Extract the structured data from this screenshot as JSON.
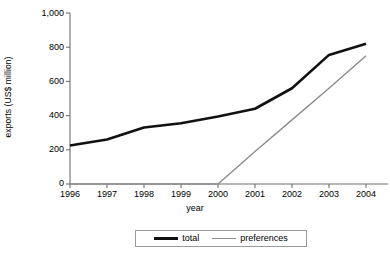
{
  "chart_data": {
    "type": "line",
    "title": "",
    "xlabel": "year",
    "ylabel": "exports (US$ million)",
    "categories": [
      "1996",
      "1997",
      "1998",
      "1999",
      "2000",
      "2001",
      "2002",
      "2003",
      "2004"
    ],
    "x": [
      1996,
      1997,
      1998,
      1999,
      2000,
      2001,
      2002,
      2003,
      2004
    ],
    "xlim": [
      1996,
      2004
    ],
    "ylim": [
      0,
      1000
    ],
    "yticks": [
      0,
      200,
      400,
      600,
      800,
      1000
    ],
    "ytick_labels": [
      "0",
      "200",
      "400",
      "600",
      "800",
      "1,000"
    ],
    "grid": false,
    "legend_position": "bottom-center",
    "series": [
      {
        "name": "total",
        "color": "#111111",
        "width": 2.6,
        "values": [
          225,
          260,
          330,
          355,
          395,
          440,
          560,
          755,
          820
        ]
      },
      {
        "name": "preferences",
        "color": "#8c8c8c",
        "width": 1.4,
        "values": [
          0,
          0,
          0,
          0,
          0,
          190,
          375,
          560,
          750
        ]
      }
    ]
  },
  "axes": {
    "y_title": "exports (US$ million)",
    "x_title": "year",
    "y_tick_labels": [
      "1,000",
      "800",
      "600",
      "400",
      "200",
      "0"
    ],
    "x_tick_labels": [
      "1996",
      "1997",
      "1998",
      "1999",
      "2000",
      "2001",
      "2002",
      "2003",
      "2004"
    ]
  },
  "legend": {
    "items": [
      {
        "label": "total",
        "swatch": "thick-black-line"
      },
      {
        "label": "preferences",
        "swatch": "thin-gray-line"
      }
    ]
  },
  "colors": {
    "total": "#111111",
    "preferences": "#8c8c8c",
    "axis": "#6f6f6f",
    "background": "#ffffff"
  }
}
